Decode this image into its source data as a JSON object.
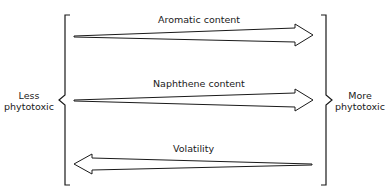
{
  "diagram": {
    "left_label": [
      "Less",
      "phytotoxic"
    ],
    "right_label": [
      "More",
      "phytotoxic"
    ],
    "arrows": [
      {
        "label": "Aromatic content",
        "direction": "right"
      },
      {
        "label": "Naphthene content",
        "direction": "right"
      },
      {
        "label": "Volatility",
        "direction": "left"
      }
    ]
  }
}
